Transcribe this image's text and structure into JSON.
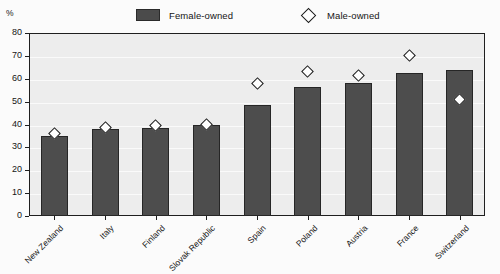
{
  "chart_data": {
    "type": "bar",
    "title": "",
    "subtitle": "",
    "xlabel": "",
    "ylabel": "%",
    "unit": "%",
    "ylim": [
      0,
      80
    ],
    "ytick_step": 10,
    "yticks": [
      "80",
      "70",
      "60",
      "50",
      "40",
      "30",
      "20",
      "10",
      "0"
    ],
    "grid": true,
    "legend_position": "top",
    "categories": [
      "New Zealand",
      "Italy",
      "Finland",
      "Slovak Republic",
      "Spain",
      "Poland",
      "Austria",
      "France",
      "Switzerland"
    ],
    "series": [
      {
        "name": "Female-owned",
        "type": "bar",
        "color": "#4d4d4d",
        "values": [
          35,
          38,
          38.5,
          40,
          48.5,
          56.5,
          58,
          62.5,
          64
        ]
      },
      {
        "name": "Male-owned",
        "type": "scatter",
        "marker": "diamond",
        "color": "#ffffff",
        "edge_color": "#161616",
        "values": [
          36,
          38.5,
          39.5,
          40,
          58,
          63,
          61.5,
          70,
          51
        ]
      }
    ]
  },
  "legend": {
    "items": [
      {
        "label": "Female-owned",
        "marker": "filled-square"
      },
      {
        "label": "Male-owned",
        "marker": "open-diamond"
      }
    ]
  },
  "colors": {
    "bar": "#4d4d4d",
    "bar_edge": "#262626",
    "marker_fill": "#ffffff",
    "marker_edge": "#161616",
    "plot_background": "#ededed",
    "page_background": "#fbfbfb",
    "axis": "#1f1f1f",
    "gridline": "#fafafa"
  }
}
